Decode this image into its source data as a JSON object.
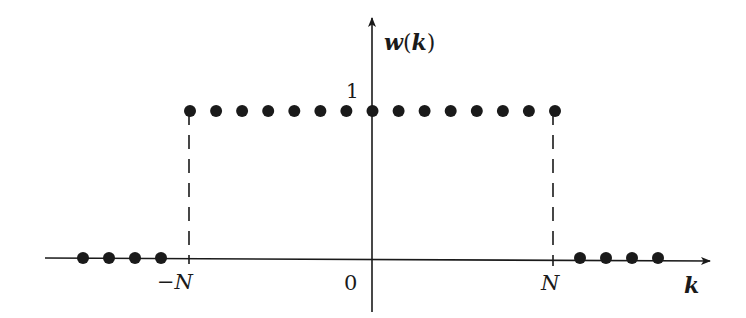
{
  "diagram": {
    "y_axis_label_fn": "w",
    "y_axis_label_arg": "k",
    "x_axis_label": "k",
    "y_tick_label": "1",
    "x_tick_labels": {
      "neg_n": "−N",
      "zero": "0",
      "pos_n": "N"
    },
    "colors": {
      "ink": "#1a1a1a",
      "background": "#ffffff"
    }
  },
  "chart_data": {
    "type": "scatter",
    "title": "w(k)",
    "xlabel": "k",
    "ylabel": "w(k)",
    "x_tick_labels": [
      "−N",
      "0",
      "N"
    ],
    "y_tick_labels": [
      "1"
    ],
    "N": 7,
    "points": [
      {
        "k": -11,
        "w": 0
      },
      {
        "k": -10,
        "w": 0
      },
      {
        "k": -9,
        "w": 0
      },
      {
        "k": -8,
        "w": 0
      },
      {
        "k": -7,
        "w": 1
      },
      {
        "k": -6,
        "w": 1
      },
      {
        "k": -5,
        "w": 1
      },
      {
        "k": -4,
        "w": 1
      },
      {
        "k": -3,
        "w": 1
      },
      {
        "k": -2,
        "w": 1
      },
      {
        "k": -1,
        "w": 1
      },
      {
        "k": 0,
        "w": 1
      },
      {
        "k": 1,
        "w": 1
      },
      {
        "k": 2,
        "w": 1
      },
      {
        "k": 3,
        "w": 1
      },
      {
        "k": 4,
        "w": 1
      },
      {
        "k": 5,
        "w": 1
      },
      {
        "k": 6,
        "w": 1
      },
      {
        "k": 7,
        "w": 1
      },
      {
        "k": 8,
        "w": 0
      },
      {
        "k": 9,
        "w": 0
      },
      {
        "k": 10,
        "w": 0
      },
      {
        "k": 11,
        "w": 0
      }
    ],
    "dashed_guides_at": [
      "−N",
      "N"
    ],
    "grid": false,
    "legend": null
  }
}
